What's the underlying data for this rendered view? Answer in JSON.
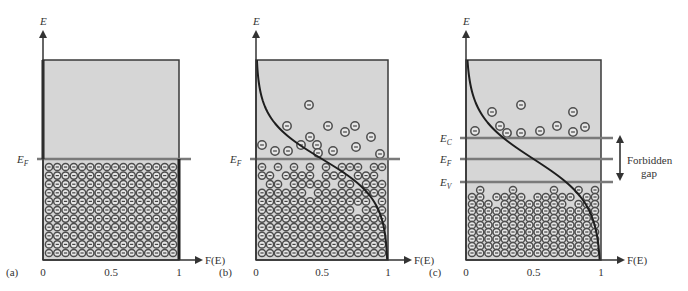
{
  "figure": {
    "colors": {
      "box_fill": "#d6d6d6",
      "box_stroke": "#3a3a3a",
      "level_line": "#7a7a7a",
      "curve": "#1e1e1e",
      "electron_ring": "#4d4d4d",
      "electron_fill": "#e6e6e6",
      "text": "#333333"
    },
    "axis_labels": {
      "y": "E",
      "x": "F(E)"
    },
    "tick_labels": [
      "0",
      "0.5",
      "1"
    ],
    "panels": [
      {
        "id": "a",
        "tag": "(a)",
        "x0": 43,
        "x1": 179,
        "top": 60,
        "bottom": 260,
        "levels": [
          {
            "name": "E_F",
            "label_main": "E",
            "label_sub": "F",
            "y": 159
          }
        ],
        "curve": "step",
        "grid": {
          "cols": 16,
          "rows": 11,
          "top_y": 167,
          "missing": []
        },
        "free_electrons": []
      },
      {
        "id": "b",
        "tag": "(b)",
        "x0": 256,
        "x1": 388,
        "top": 60,
        "bottom": 260,
        "levels": [
          {
            "name": "E_F",
            "label_main": "E",
            "label_sub": "F",
            "y": 159
          }
        ],
        "curve": "fermi",
        "curve_center_y": 159,
        "curve_kT": 20,
        "grid": {
          "cols": 16,
          "rows": 11,
          "top_y": 167,
          "missing": [
            [
              0,
              1
            ],
            [
              0,
              3
            ],
            [
              0,
              5
            ],
            [
              0,
              7
            ],
            [
              0,
              9
            ],
            [
              0,
              13
            ],
            [
              1,
              2
            ],
            [
              1,
              7
            ],
            [
              1,
              11
            ],
            [
              1,
              15
            ],
            [
              2,
              0
            ],
            [
              2,
              3
            ],
            [
              2,
              9
            ],
            [
              2,
              12
            ],
            [
              3,
              6
            ],
            [
              4,
              14
            ],
            [
              5,
              12
            ]
          ]
        },
        "free_electrons": [
          [
            309,
            105
          ],
          [
            287,
            126
          ],
          [
            328,
            126
          ],
          [
            355,
            126
          ],
          [
            310,
            137
          ],
          [
            345,
            132
          ],
          [
            371,
            137
          ],
          [
            262,
            145
          ],
          [
            275,
            151
          ],
          [
            288,
            151
          ],
          [
            301,
            145
          ],
          [
            317,
            145
          ],
          [
            333,
            151
          ],
          [
            356,
            147
          ],
          [
            318,
            153
          ],
          [
            380,
            154
          ]
        ]
      },
      {
        "id": "c",
        "tag": "(c)",
        "x0": 466,
        "x1": 601,
        "top": 60,
        "bottom": 260,
        "levels": [
          {
            "name": "E_C",
            "label_main": "E",
            "label_sub": "C",
            "y": 138
          },
          {
            "name": "E_F",
            "label_main": "E",
            "label_sub": "F",
            "y": 159
          },
          {
            "name": "E_V",
            "label_main": "E",
            "label_sub": "V",
            "y": 182
          }
        ],
        "curve": "fermi",
        "curve_center_y": 159,
        "curve_kT": 22,
        "grid": {
          "cols": 16,
          "rows": 10,
          "top_y": 190,
          "missing": [
            [
              0,
              0
            ],
            [
              0,
              2
            ],
            [
              0,
              3
            ],
            [
              0,
              4
            ],
            [
              0,
              6
            ],
            [
              0,
              7
            ],
            [
              0,
              8
            ],
            [
              0,
              9
            ],
            [
              0,
              11
            ],
            [
              0,
              12
            ],
            [
              0,
              14
            ],
            [
              1,
              2
            ],
            [
              1,
              7
            ],
            [
              1,
              13
            ],
            [
              2,
              3
            ],
            [
              2,
              12
            ]
          ]
        },
        "free_electrons": [
          [
            521,
            105
          ],
          [
            492,
            112
          ],
          [
            573,
            112
          ],
          [
            475,
            131
          ],
          [
            500,
            126
          ],
          [
            507,
            133
          ],
          [
            521,
            133
          ],
          [
            540,
            131
          ],
          [
            557,
            126
          ],
          [
            573,
            132
          ],
          [
            585,
            127
          ]
        ]
      }
    ],
    "gap_annotation": {
      "line1": "Forbidden",
      "line2": "gap",
      "arrow_x": 620,
      "y_top": 138,
      "y_bottom": 182
    }
  }
}
